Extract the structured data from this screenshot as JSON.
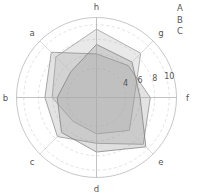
{
  "chart_data": {
    "type": "radar",
    "title": "",
    "subtitle": "",
    "xlabel": "",
    "ylabel": "",
    "grid": true,
    "legend_position": "top-right",
    "categories": [
      "f",
      "g",
      "h",
      "a",
      "b",
      "c",
      "d",
      "e"
    ],
    "axis_labels": {
      "a": "a",
      "b": "b",
      "c": "c",
      "d": "d",
      "e": "e",
      "f": "f",
      "g": "g",
      "h": "h"
    },
    "radial_ticks": [
      4,
      6,
      8,
      10
    ],
    "radial_tick_labels": [
      "4",
      "6",
      "8",
      "10"
    ],
    "rlim": [
      0,
      11
    ],
    "series": [
      {
        "name": "A",
        "values": [
          5.2,
          8.6,
          9.4,
          7.9,
          6.1,
          4.6,
          5.0,
          6.4
        ],
        "color": "#9a9a9a",
        "fill": "#b5b5b5",
        "fill_opacity": 0.3
      },
      {
        "name": "B",
        "values": [
          7.4,
          6.2,
          6.0,
          8.8,
          7.1,
          7.6,
          6.3,
          9.1
        ],
        "color": "#8e8e8e",
        "fill": "#a3a3a3",
        "fill_opacity": 0.3
      },
      {
        "name": "C",
        "values": [
          6.0,
          6.9,
          7.3,
          5.0,
          5.4,
          6.8,
          7.5,
          9.6
        ],
        "color": "#7f7f7f",
        "fill": "#969696",
        "fill_opacity": 0.3
      }
    ]
  },
  "legend": {
    "entries": [
      {
        "label": "A"
      },
      {
        "label": "B"
      },
      {
        "label": "C"
      }
    ]
  }
}
